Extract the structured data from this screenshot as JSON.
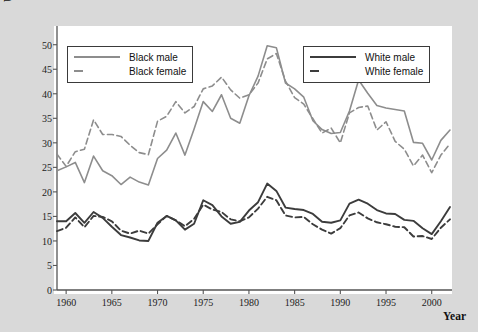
{
  "axes": {
    "ylabel": "Unemployment rate\n(percent)",
    "xlabel": "Year",
    "yticks": [
      0,
      5,
      10,
      15,
      20,
      25,
      30,
      35,
      40,
      45,
      50
    ],
    "xticks": [
      1960,
      1965,
      1970,
      1975,
      1980,
      1985,
      1990,
      1995,
      2000
    ]
  },
  "legend_black": {
    "male_label": "Black male",
    "female_label": "Black female"
  },
  "legend_white": {
    "male_label": "White male",
    "female_label": "White female"
  },
  "colors": {
    "black_series": "#8d8d8d",
    "white_series": "#3c3c3c",
    "axis": "#555555",
    "plot_bg": "#ffffff",
    "figure_bg": "#d9d9d9"
  },
  "chart_data": {
    "type": "line",
    "title": "",
    "xlabel": "Year",
    "ylabel": "Unemployment rate (percent)",
    "xlim": [
      1959,
      2002
    ],
    "ylim": [
      0,
      53
    ],
    "grid": false,
    "legend_position": "inside-top-left and inside-top-right",
    "x": [
      1959,
      1960,
      1961,
      1962,
      1963,
      1964,
      1965,
      1966,
      1967,
      1968,
      1969,
      1970,
      1971,
      1972,
      1973,
      1974,
      1975,
      1976,
      1977,
      1978,
      1979,
      1980,
      1981,
      1982,
      1983,
      1984,
      1985,
      1986,
      1987,
      1988,
      1989,
      1990,
      1991,
      1992,
      1993,
      1994,
      1995,
      1996,
      1997,
      1998,
      1999,
      2000,
      2001,
      2002
    ],
    "series": [
      {
        "name": "Black male",
        "style": "solid",
        "color": "#8d8d8d",
        "values": [
          24.3,
          25.1,
          26.0,
          21.9,
          27.3,
          24.3,
          23.3,
          21.5,
          23.0,
          22.0,
          21.4,
          26.8,
          28.5,
          32.0,
          27.5,
          32.8,
          38.4,
          36.4,
          39.8,
          35.0,
          34.0,
          39.6,
          43.6,
          49.8,
          49.4,
          42.2,
          41.0,
          39.3,
          34.5,
          32.7,
          31.9,
          32.1,
          36.5,
          42.8,
          40.1,
          37.6,
          37.1,
          36.8,
          36.5,
          30.1,
          29.9,
          26.5,
          30.5,
          32.6
        ]
      },
      {
        "name": "Black female",
        "style": "dashed",
        "color": "#8d8d8d",
        "values": [
          27.7,
          25.2,
          28.2,
          28.7,
          34.7,
          31.7,
          31.7,
          31.3,
          29.5,
          28.0,
          27.6,
          34.4,
          35.4,
          38.4,
          36.1,
          37.4,
          41.0,
          41.6,
          43.4,
          40.8,
          39.1,
          39.8,
          42.2,
          47.1,
          48.2,
          42.6,
          39.2,
          37.9,
          34.9,
          32.0,
          33.0,
          30.0,
          36.1,
          37.2,
          37.5,
          32.6,
          34.3,
          30.3,
          28.7,
          25.3,
          27.5,
          23.9,
          27.5,
          29.8
        ]
      },
      {
        "name": "White male",
        "style": "solid",
        "color": "#3c3c3c",
        "values": [
          14.0,
          14.0,
          15.7,
          13.7,
          15.9,
          14.7,
          12.9,
          11.2,
          10.7,
          10.1,
          10.0,
          13.7,
          15.1,
          14.2,
          12.3,
          13.5,
          18.3,
          17.3,
          15.0,
          13.5,
          13.9,
          16.2,
          17.9,
          21.7,
          20.2,
          16.8,
          16.5,
          16.3,
          15.5,
          13.9,
          13.7,
          14.2,
          17.6,
          18.4,
          17.6,
          16.3,
          15.6,
          15.5,
          14.3,
          14.1,
          12.6,
          11.4,
          14.0,
          16.9
        ]
      },
      {
        "name": "White female",
        "style": "dashed",
        "color": "#3c3c3c",
        "values": [
          12.0,
          12.7,
          14.8,
          12.8,
          15.1,
          14.9,
          14.0,
          12.1,
          11.5,
          12.1,
          11.5,
          13.4,
          15.1,
          14.2,
          13.0,
          14.5,
          17.4,
          16.4,
          15.9,
          14.4,
          14.0,
          14.8,
          16.6,
          19.0,
          18.3,
          15.2,
          14.8,
          14.9,
          13.4,
          12.3,
          11.5,
          12.6,
          15.2,
          15.8,
          14.6,
          13.8,
          13.4,
          12.9,
          12.8,
          10.9,
          11.0,
          10.4,
          12.7,
          14.4
        ]
      }
    ]
  }
}
